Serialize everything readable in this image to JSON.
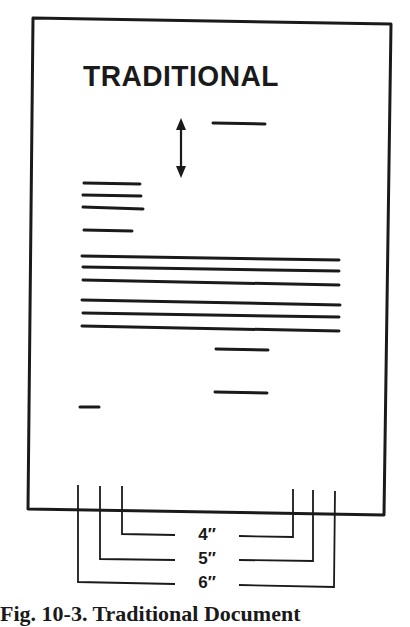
{
  "figure": {
    "title": "TRADITIONAL",
    "caption": "Fig. 10-3. Traditional Document",
    "ink_color": "#1a1a1a",
    "paper_color": "#ffffff"
  },
  "page": {
    "border": {
      "top_left": [
        33,
        18
      ],
      "top_right": [
        391,
        24
      ],
      "bottom_right": [
        384,
        515
      ],
      "bottom_left": [
        28,
        509
      ]
    },
    "spacing_arrow": {
      "x": 181,
      "y_top": 119,
      "y_bottom": 177
    },
    "date_line": {
      "x1": 213,
      "x2": 265,
      "y": 124
    },
    "address_lines": [
      {
        "x1": 84,
        "x2": 140,
        "y": 184
      },
      {
        "x1": 83,
        "x2": 141,
        "y": 196
      },
      {
        "x1": 83,
        "x2": 143,
        "y": 208
      }
    ],
    "salutation_line": {
      "x1": 84,
      "x2": 132,
      "y": 231
    },
    "body_paragraphs": [
      [
        {
          "x1": 82,
          "y1": 256,
          "x2": 339,
          "y2": 260
        },
        {
          "x1": 83,
          "y1": 267,
          "x2": 339,
          "y2": 271
        },
        {
          "x1": 83,
          "y1": 280,
          "x2": 339,
          "y2": 285
        }
      ],
      [
        {
          "x1": 82,
          "y1": 300,
          "x2": 340,
          "y2": 305
        },
        {
          "x1": 83,
          "y1": 313,
          "x2": 339,
          "y2": 317
        },
        {
          "x1": 82,
          "y1": 326,
          "x2": 339,
          "y2": 331
        }
      ]
    ],
    "closing_line": {
      "x1": 216,
      "x2": 268,
      "y": 349
    },
    "signature_line": {
      "x1": 215,
      "x2": 267,
      "y": 392
    },
    "reference_line": {
      "x1": 80,
      "x2": 99,
      "y": 407
    }
  },
  "margin_dimensions": [
    {
      "label": "4″",
      "left_x": 122,
      "right_x": 293,
      "y": 534,
      "top_left": 486,
      "top_right": 489
    },
    {
      "label": "5″",
      "left_x": 100,
      "right_x": 313,
      "y": 559,
      "top_left": 486,
      "top_right": 490
    },
    {
      "label": "6″",
      "left_x": 78,
      "right_x": 335,
      "y": 582,
      "top_left": 485,
      "top_right": 491
    }
  ]
}
